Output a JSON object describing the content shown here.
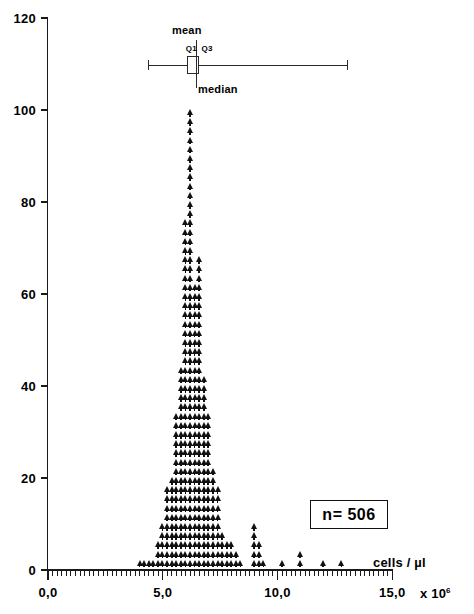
{
  "chart_data": {
    "type": "scatter",
    "title": "",
    "subtitle": "",
    "xlabel": "cells / µl",
    "ylabel": "",
    "x_multiplier": "x 10",
    "x_exponent": "6",
    "xlim": [
      0.0,
      15.0
    ],
    "ylim": [
      0,
      120
    ],
    "grid": false,
    "legend": null,
    "y_ticks": [
      0,
      20,
      40,
      60,
      80,
      100,
      120
    ],
    "y_tick_labels": [
      "0",
      "20",
      "40",
      "60",
      "80",
      "100",
      "120"
    ],
    "x_ticks": [
      0.0,
      5.0,
      10.0,
      15.0
    ],
    "x_tick_labels": [
      "0,0",
      "5,0",
      "10,0",
      "15,0"
    ],
    "x_minor_tick_step": 0.2,
    "marker": "triangle-up",
    "marker_color": "#111111",
    "bin_width": 0.2,
    "note": "Dot-histogram: each stacked triangle marker column is one bin; height = count",
    "categories": [
      "4.0",
      "4.2",
      "4.4",
      "4.6",
      "4.8",
      "5.0",
      "5.2",
      "5.4",
      "5.6",
      "5.8",
      "6.0",
      "6.2",
      "6.4",
      "6.6",
      "6.8",
      "7.0",
      "7.2",
      "7.4",
      "7.6",
      "7.8",
      "8.0",
      "8.2",
      "8.4",
      "8.6",
      "8.8",
      "9.0",
      "9.2",
      "9.4",
      "9.6",
      "9.8",
      "10.0",
      "10.2",
      "10.4",
      "10.6",
      "10.8",
      "11.0",
      "11.2",
      "11.4",
      "11.6",
      "11.8",
      "12.0",
      "12.2",
      "12.4",
      "12.6",
      "12.8",
      "13.0"
    ],
    "values": [
      1,
      1,
      2,
      2,
      5,
      9,
      18,
      20,
      34,
      44,
      75,
      100,
      61,
      67,
      41,
      33,
      22,
      18,
      7,
      6,
      5,
      3,
      2,
      0,
      0,
      10,
      6,
      2,
      0,
      0,
      0,
      2,
      0,
      0,
      0,
      3,
      0,
      0,
      0,
      0,
      2,
      0,
      0,
      0,
      2,
      0
    ],
    "n_total": 506,
    "annotations": [
      {
        "name": "sample-size",
        "text": "n= 506",
        "boxed": true
      }
    ],
    "boxplot": {
      "whisker_low": 4.35,
      "q1": 6.05,
      "median": 6.45,
      "mean": 6.45,
      "q3": 6.6,
      "whisker_high": 13.05,
      "labels": {
        "mean": "mean",
        "median": "median",
        "q1": "Q1",
        "q3": "Q3"
      }
    }
  },
  "colors": {
    "marker": "#111111",
    "axis": "#1a1a1a",
    "boxplot": "#2a2a2a",
    "background": "#ffffff"
  }
}
